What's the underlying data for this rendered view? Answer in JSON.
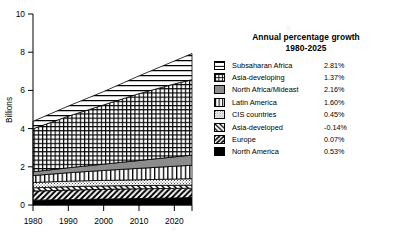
{
  "chart_data": {
    "type": "area",
    "stacked": true,
    "title": "",
    "xlabel": "",
    "ylabel": "Billions",
    "xlim": [
      1980,
      2025
    ],
    "ylim": [
      0,
      10
    ],
    "xticks": [
      1980,
      1990,
      2000,
      2010,
      2020
    ],
    "yticks": [
      0,
      2,
      4,
      6,
      8,
      10
    ],
    "xtick_labels": [
      "1980",
      "1990",
      "2000",
      "2010",
      "2020"
    ],
    "ytick_labels": [
      "0",
      "2",
      "4",
      "6",
      "8",
      "10"
    ],
    "grid": false,
    "legend_position": "right",
    "x": [
      1980,
      1990,
      2000,
      2010,
      2020,
      2025
    ],
    "series": [
      {
        "name": "North America",
        "growth": "0.53%",
        "pattern": "solid-black",
        "values": [
          0.25,
          0.28,
          0.31,
          0.34,
          0.37,
          0.39
        ]
      },
      {
        "name": "Europe",
        "growth": "0.07%",
        "pattern": "diagonal-forward",
        "values": [
          0.48,
          0.5,
          0.51,
          0.51,
          0.5,
          0.49
        ]
      },
      {
        "name": "Asia-developed",
        "growth": "-0.14%",
        "pattern": "diagonal-back",
        "values": [
          0.17,
          0.18,
          0.18,
          0.17,
          0.16,
          0.16
        ]
      },
      {
        "name": "CIS countries",
        "growth": "0.45%",
        "pattern": "dotted",
        "values": [
          0.28,
          0.29,
          0.29,
          0.3,
          0.33,
          0.34
        ]
      },
      {
        "name": "Latin America",
        "growth": "1.60%",
        "pattern": "vertical-lines",
        "values": [
          0.36,
          0.44,
          0.52,
          0.6,
          0.67,
          0.7
        ]
      },
      {
        "name": "North Africa/Mideast",
        "growth": "2.16%",
        "pattern": "solid-gray",
        "values": [
          0.2,
          0.26,
          0.33,
          0.41,
          0.49,
          0.53
        ]
      },
      {
        "name": "Asia-developing",
        "growth": "1.37%",
        "pattern": "cross-grid",
        "values": [
          2.25,
          2.7,
          3.1,
          3.5,
          3.82,
          3.95
        ]
      },
      {
        "name": "Subsaharan Africa",
        "growth": "2.81%",
        "pattern": "horizontal-lines",
        "values": [
          0.39,
          0.53,
          0.7,
          0.93,
          1.2,
          1.37
        ]
      }
    ],
    "stack_totals": [
      4.38,
      5.18,
      5.94,
      6.76,
      7.54,
      7.93
    ],
    "legend_title_line1": "Annual percentage growth",
    "legend_title_line2": "1980-2025"
  },
  "legend": {
    "title_line1": "Annual percentage growth",
    "title_line2": "1980-2025",
    "items": [
      {
        "label": "Subsaharan Africa",
        "value": "2.81%",
        "pattern": "horizontal-lines"
      },
      {
        "label": "Asia-developing",
        "value": "1.37%",
        "pattern": "cross-grid"
      },
      {
        "label": "North Africa/Mideast",
        "value": "2.16%",
        "pattern": "solid-gray"
      },
      {
        "label": "Latin America",
        "value": "1.60%",
        "pattern": "vertical-lines"
      },
      {
        "label": "CIS countries",
        "value": "0.45%",
        "pattern": "dotted"
      },
      {
        "label": "Asia-developed",
        "value": "-0.14%",
        "pattern": "diagonal-back"
      },
      {
        "label": "Europe",
        "value": "0.07%",
        "pattern": "diagonal-forward"
      },
      {
        "label": "North America",
        "value": "0.53%",
        "pattern": "solid-black"
      }
    ]
  },
  "axes": {
    "y_title": "Billions",
    "y_labels": [
      "10",
      "8",
      "6",
      "4",
      "2",
      "0"
    ],
    "x_labels": [
      "1980",
      "1990",
      "2000",
      "2010",
      "2020"
    ]
  },
  "colors": {
    "ink": "#000000",
    "gray_fill": "#8c8c8c",
    "light_gray": "#d9d9d9",
    "background": "#ffffff"
  }
}
